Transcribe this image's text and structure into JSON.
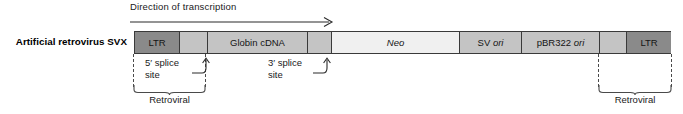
{
  "figure": {
    "construct_name": "Artificial retrovirus SVX",
    "transcription_label": "Direction of transcription",
    "transcription_arrow_icon": "right-arrow-icon"
  },
  "segments": [
    {
      "label": "LTR",
      "shade": "dark",
      "width_px": 44,
      "italic_part": ""
    },
    {
      "label": "",
      "shade": "spacer",
      "width_px": 28,
      "italic_part": ""
    },
    {
      "label": "Globin cDNA",
      "shade": "mid",
      "width_px": 100,
      "italic_part": ""
    },
    {
      "label": "",
      "shade": "spacer",
      "width_px": 24,
      "italic_part": ""
    },
    {
      "label": "Neo",
      "shade": "light",
      "width_px": 128,
      "italic_part": "Neo"
    },
    {
      "label": "SV ori",
      "shade": "mid",
      "width_px": 62,
      "italic_part": "ori"
    },
    {
      "label": "pBR322 ori",
      "shade": "mid",
      "width_px": 78,
      "italic_part": "ori"
    },
    {
      "label": "",
      "shade": "spacer",
      "width_px": 27,
      "italic_part": ""
    },
    {
      "label": "LTR",
      "shade": "dark",
      "width_px": 45,
      "italic_part": ""
    }
  ],
  "annotations": {
    "five_prime_splice": {
      "line1": "5′ splice",
      "line2": "site"
    },
    "three_prime_splice": {
      "line1": "3′ splice",
      "line2": "site"
    },
    "left_bracket_caption": "Retroviral",
    "right_bracket_caption": "Retroviral"
  },
  "colors": {
    "dark_segment": "#8a8a8a",
    "mid_segment": "#c4c4c4",
    "light_segment": "#f0f0f0",
    "outline": "#3a3a3a",
    "dashed_bracket": "#4a4a4a",
    "text": "#1a1a1a"
  }
}
